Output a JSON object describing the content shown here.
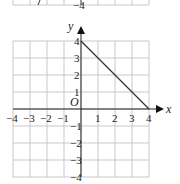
{
  "top_fragment": {
    "label": "−4"
  },
  "graph": {
    "x_axis_label": "x",
    "y_axis_label": "y",
    "origin_label": "O",
    "x_ticks": [
      "−4",
      "−3",
      "−2",
      "−1",
      "1",
      "2",
      "3",
      "4"
    ],
    "y_ticks": [
      "4",
      "3",
      "2",
      "1",
      "−1",
      "−2",
      "−3",
      "−4"
    ],
    "segment": {
      "from": [
        0,
        4
      ],
      "to": [
        4,
        0
      ]
    }
  },
  "chart_data": {
    "type": "line",
    "title": "",
    "xlabel": "x",
    "ylabel": "y",
    "xlim": [
      -4,
      4
    ],
    "ylim": [
      -4,
      4
    ],
    "grid": true,
    "series": [
      {
        "name": "segment",
        "x": [
          0,
          4
        ],
        "y": [
          4,
          0
        ]
      }
    ]
  }
}
